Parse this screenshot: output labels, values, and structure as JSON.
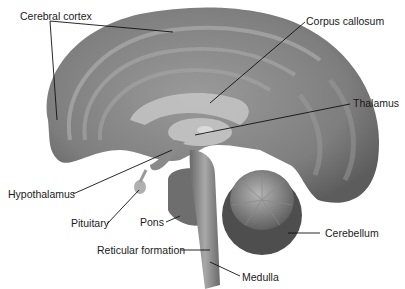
{
  "diagram": {
    "labels": {
      "cerebral_cortex": "Cerebral cortex",
      "corpus_callosum": "Corpus callosum",
      "thalamus": "Thalamus",
      "hypothalamus": "Hypothalamus",
      "pituitary": "Pituitary",
      "pons": "Pons",
      "reticular_formation": "Reticular formation",
      "cerebellum": "Cerebellum",
      "medulla": "Medulla"
    }
  }
}
